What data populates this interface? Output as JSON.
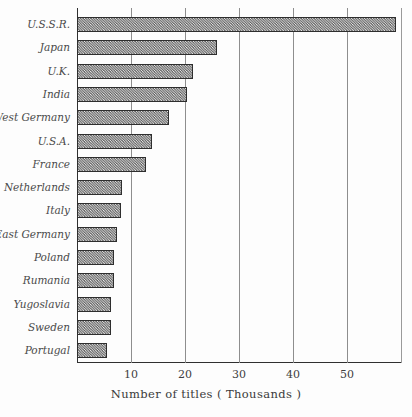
{
  "chart_data": {
    "type": "bar",
    "orientation": "horizontal",
    "title": "",
    "xlabel": "Number of titles  ( Thousands )",
    "ylabel": "",
    "xlim": [
      0,
      60
    ],
    "xticks": [
      10,
      20,
      30,
      40,
      50
    ],
    "xtick_labels": [
      "10",
      "20",
      "30",
      "40",
      "50"
    ],
    "grid": true,
    "grid_axis": "x",
    "legend": "none",
    "categories": [
      "U.S.S.R.",
      "Japan",
      "U.K.",
      "India",
      "West Germany",
      "U.S.A.",
      "France",
      "Netherlands",
      "Italy",
      "East Germany",
      "Poland",
      "Rumania",
      "Yugoslavia",
      "Sweden",
      "Portugal"
    ],
    "values": [
      59,
      26,
      21.5,
      20.4,
      17,
      13.9,
      12.8,
      8.3,
      8.1,
      7.4,
      6.9,
      6.9,
      6.3,
      6.3,
      5.6
    ],
    "units": "thousands of titles",
    "bar_fill": "#b4b4b4",
    "bar_edge": "#2e2e2e",
    "grid_color": "#8e8e8e",
    "axis_color": "#303030"
  },
  "figure": {
    "caption": ""
  }
}
